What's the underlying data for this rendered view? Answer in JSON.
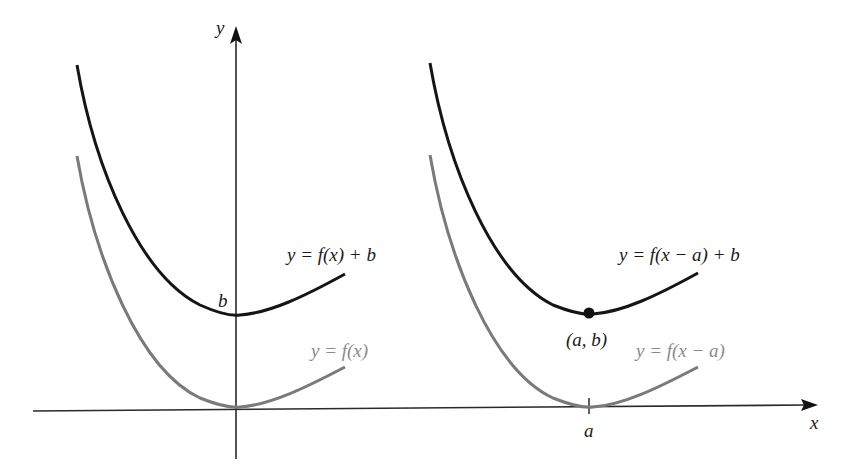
{
  "diagram": {
    "colors": {
      "axis": "#2a2a2a",
      "shifted_curve": "#151515",
      "original_curve": "#7a7a7a",
      "original_label": "#8a8a8a",
      "shifted_label": "#1a1a1a"
    },
    "axes": {
      "x_label": "x",
      "y_label": "y"
    },
    "left_panel": {
      "upper_curve_label": "y = f(x) + b",
      "lower_curve_label": "y = f(x)",
      "intercept_label": "b"
    },
    "right_panel": {
      "upper_curve_label": "y = f(x − a) + b",
      "lower_curve_label": "y = f(x − a)",
      "point_label": "(a, b)",
      "tick_label": "a"
    }
  }
}
